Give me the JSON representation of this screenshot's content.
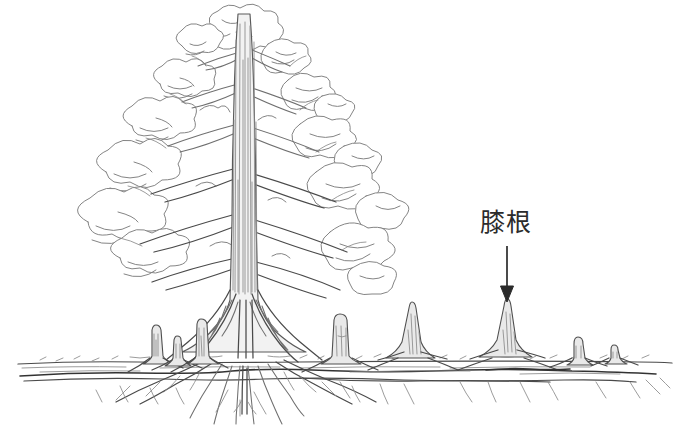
{
  "figure": {
    "kind": "hand-drawn-botanical-illustration",
    "background_color": "#ffffff",
    "ink_color": "#6b6b6b",
    "ink_dark_color": "#3f3f3f",
    "label_color": "#2b2b2b",
    "width": 680,
    "height": 434
  },
  "annotation": {
    "label_text": "膝根",
    "label_x": 480,
    "label_y": 210,
    "arrow": {
      "name": "annotation-arrow",
      "x": 507,
      "y_start": 246,
      "y_end": 302,
      "color": "#2b2b2b"
    }
  },
  "ground": {
    "line_y": 362,
    "left_x": 18,
    "right_x": 672,
    "lateral_root_y": 371
  },
  "tree": {
    "trunk_center_x": 243,
    "crown_top_y": 8,
    "crown_bottom_y": 300,
    "base_y": 362,
    "taproot_bottom_y": 416
  },
  "knee_roots": [
    {
      "name": "knee-root-1",
      "x": 156,
      "top_y": 327,
      "width": 9,
      "base_width": 15
    },
    {
      "name": "knee-root-2",
      "x": 177,
      "top_y": 337,
      "width": 8,
      "base_width": 14
    },
    {
      "name": "knee-root-3",
      "x": 201,
      "top_y": 321,
      "width": 10,
      "base_width": 17
    },
    {
      "name": "knee-root-4",
      "x": 340,
      "top_y": 315,
      "width": 12,
      "base_width": 20
    },
    {
      "name": "knee-root-5",
      "x": 412,
      "top_y": 303,
      "width": 8,
      "base_width": 24
    },
    {
      "name": "knee-root-6",
      "x": 507,
      "top_y": 301,
      "width": 7,
      "base_width": 26
    },
    {
      "name": "knee-root-7",
      "x": 578,
      "top_y": 338,
      "width": 9,
      "base_width": 14
    },
    {
      "name": "knee-root-8",
      "x": 614,
      "top_y": 346,
      "width": 7,
      "base_width": 11
    }
  ]
}
